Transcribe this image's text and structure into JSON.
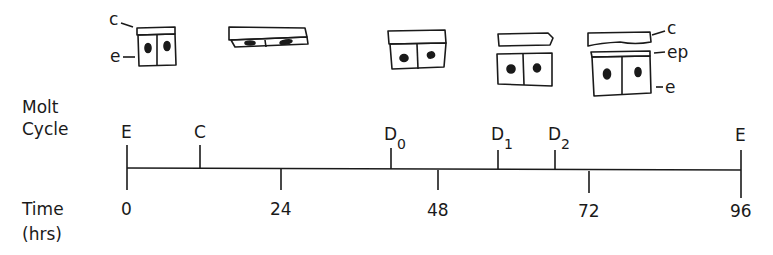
{
  "figure": {
    "row_labels": {
      "molt_cycle_line1": "Molt",
      "molt_cycle_line2": "Cycle",
      "time_line1": "Time",
      "time_line2": "(hrs)"
    },
    "cell_labels": {
      "left_c": "c",
      "left_e": "e",
      "right_c": "c",
      "right_ep": "ep",
      "right_e": "e"
    },
    "molt_stages": [
      {
        "label": "E",
        "sub": "",
        "hour": 0
      },
      {
        "label": "C",
        "sub": "",
        "hour": 12
      },
      {
        "label": "D",
        "sub": "0",
        "hour": 42
      },
      {
        "label": "D",
        "sub": "1",
        "hour": 60
      },
      {
        "label": "D",
        "sub": "2",
        "hour": 66
      },
      {
        "label": "E",
        "sub": "",
        "hour": 96
      }
    ],
    "time_ticks": [
      {
        "label": "0",
        "hour": 0
      },
      {
        "label": "24",
        "hour": 24
      },
      {
        "label": "48",
        "hour": 48
      },
      {
        "label": "72",
        "hour": 72
      },
      {
        "label": "96",
        "hour": 96
      }
    ],
    "cell_drawings": [
      {
        "stage": "E",
        "description": "cuticle attached to epidermis, tall cells"
      },
      {
        "stage": "C",
        "description": "flattened cuticle and epidermis"
      },
      {
        "stage": "D0",
        "description": "cuticle attached, cuboidal cells"
      },
      {
        "stage": "D1",
        "description": "cuticle separated (apolysis)"
      },
      {
        "stage": "D2",
        "description": "old cuticle, new epicuticle, epidermis"
      }
    ]
  }
}
